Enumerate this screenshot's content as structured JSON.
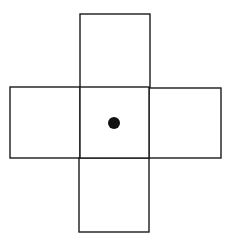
{
  "diagram": {
    "type": "cube-net-cross",
    "stroke_color": "#1a1a1a",
    "fill_color": "#ffffff",
    "background": "#ffffff",
    "dot_color": "#111111",
    "faces": [
      {
        "name": "top",
        "x": 80,
        "y": 14,
        "w": 70,
        "h": 74
      },
      {
        "name": "left",
        "x": 10,
        "y": 87,
        "w": 70,
        "h": 71
      },
      {
        "name": "center",
        "x": 80,
        "y": 87,
        "w": 69,
        "h": 71
      },
      {
        "name": "right",
        "x": 149,
        "y": 88,
        "w": 72,
        "h": 70
      },
      {
        "name": "bottom",
        "x": 79,
        "y": 158,
        "w": 70,
        "h": 74
      }
    ],
    "dot": {
      "cx": 114,
      "cy": 123,
      "r": 6
    }
  }
}
